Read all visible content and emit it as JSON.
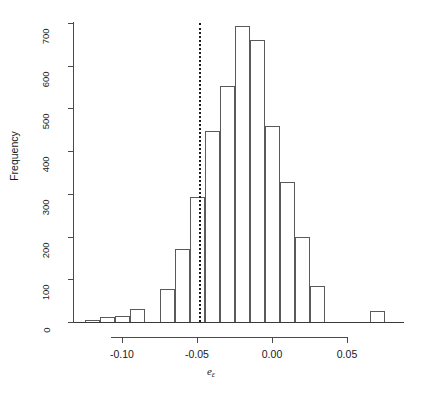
{
  "chart_data": {
    "type": "bar",
    "title": "",
    "subtitle": "",
    "xlabel": "e",
    "xlabel_subscript": "ε",
    "ylabel": "Frequency",
    "xlim": [
      -0.132,
      0.088
    ],
    "ylim": [
      0,
      700
    ],
    "grid": false,
    "legend": null,
    "bin_width": 0.01,
    "bin_starts": [
      -0.125,
      -0.115,
      -0.105,
      -0.095,
      -0.085,
      -0.075,
      -0.065,
      -0.055,
      -0.045,
      -0.035,
      -0.025,
      -0.015,
      -0.005,
      0.005,
      0.015,
      0.025,
      0.035,
      0.045,
      0.055,
      0.065,
      0.075
    ],
    "categories": [
      "-0.125",
      "-0.115",
      "-0.105",
      "-0.095",
      "-0.085",
      "-0.075",
      "-0.065",
      "-0.055",
      "-0.045",
      "-0.035",
      "-0.025",
      "-0.015",
      "-0.005",
      "0.005",
      "0.015",
      "0.025",
      "0.035",
      "0.045",
      "0.055",
      "0.065",
      "0.075"
    ],
    "values": [
      5,
      12,
      14,
      30,
      0,
      78,
      172,
      292,
      448,
      552,
      694,
      661,
      460,
      327,
      199,
      85,
      0,
      0,
      0,
      25,
      0
    ],
    "xticks": [
      -0.1,
      -0.05,
      0.0,
      0.05
    ],
    "xticklabels": [
      "-0.10",
      "-0.05",
      "0.00",
      "0.05"
    ],
    "yticks": [
      0,
      100,
      200,
      300,
      400,
      500,
      600,
      700
    ],
    "yticklabels": [
      "0",
      "100",
      "200",
      "300",
      "400",
      "500",
      "600",
      "700"
    ],
    "annotations": [
      {
        "type": "vertical-line",
        "style": "dotted",
        "x": -0.0485,
        "label": ""
      }
    ]
  }
}
